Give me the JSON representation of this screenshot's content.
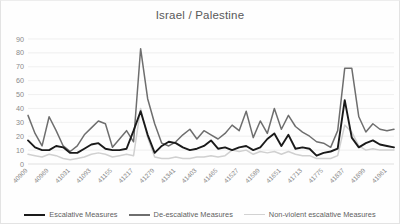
{
  "chart_data": {
    "type": "line",
    "title": "Israel / Palestine",
    "xlabel": "",
    "ylabel": "",
    "ylim": [
      0,
      90
    ],
    "ytick_step": 10,
    "yticks": [
      0,
      10,
      20,
      30,
      40,
      50,
      60,
      70,
      80,
      90
    ],
    "grid": true,
    "legend_position": "bottom",
    "x_tick_labels": [
      "40909",
      "40969",
      "41031",
      "41093",
      "41155",
      "41217",
      "41279",
      "41341",
      "41403",
      "41465",
      "41527",
      "41589",
      "41651",
      "41713",
      "41775",
      "41837",
      "41899",
      "41961"
    ],
    "x_tick_every": 3,
    "x": [
      "40909",
      "40929",
      "40949",
      "40969",
      "40989",
      "41011",
      "41031",
      "41051",
      "41071",
      "41093",
      "41113",
      "41133",
      "41155",
      "41175",
      "41195",
      "41217",
      "41237",
      "41257",
      "41279",
      "41299",
      "41319",
      "41341",
      "41361",
      "41381",
      "41403",
      "41423",
      "41443",
      "41465",
      "41485",
      "41505",
      "41527",
      "41547",
      "41567",
      "41589",
      "41609",
      "41629",
      "41651",
      "41671",
      "41691",
      "41713",
      "41733",
      "41753",
      "41775",
      "41795",
      "41815",
      "41837",
      "41857",
      "41877",
      "41899",
      "41919",
      "41939",
      "41961",
      "41981"
    ],
    "series": [
      {
        "name": "Escalative Measures",
        "color": "#1a1a1a",
        "width": 1.9,
        "values": [
          17,
          12,
          10,
          10,
          13,
          12,
          8,
          8,
          11,
          14,
          15,
          11,
          10,
          10,
          11,
          24,
          38,
          21,
          8,
          13,
          16,
          15,
          12,
          10,
          11,
          13,
          17,
          11,
          12,
          10,
          12,
          13,
          10,
          12,
          18,
          22,
          13,
          21,
          11,
          12,
          11,
          6,
          8,
          9,
          11,
          46,
          19,
          12,
          15,
          17,
          14,
          13,
          12
        ]
      },
      {
        "name": "De-escalative Measures",
        "color": "#6e6e6e",
        "width": 1.5,
        "values": [
          35,
          22,
          13,
          34,
          24,
          13,
          9,
          13,
          21,
          26,
          31,
          29,
          12,
          18,
          24,
          16,
          83,
          47,
          29,
          15,
          13,
          16,
          21,
          25,
          18,
          24,
          21,
          18,
          22,
          28,
          24,
          38,
          19,
          31,
          22,
          40,
          25,
          35,
          27,
          23,
          20,
          16,
          15,
          12,
          24,
          69,
          69,
          34,
          23,
          29,
          25,
          24,
          25
        ]
      },
      {
        "name": "Non-violent escalative Measures",
        "color": "#d0d0d0",
        "width": 1.5,
        "values": [
          7,
          6,
          5,
          7,
          6,
          4,
          3,
          4,
          5,
          7,
          8,
          7,
          5,
          6,
          7,
          6,
          40,
          19,
          5,
          4,
          4,
          5,
          4,
          4,
          5,
          5,
          6,
          5,
          6,
          10,
          9,
          10,
          7,
          9,
          8,
          9,
          7,
          9,
          7,
          6,
          6,
          4,
          4,
          4,
          6,
          28,
          23,
          13,
          10,
          11,
          10,
          10,
          10
        ]
      }
    ]
  },
  "legend": [
    {
      "label": "Escalative Measures",
      "color": "#1a1a1a",
      "width": "2.4px"
    },
    {
      "label": "De-escalative Measures",
      "color": "#6e6e6e",
      "width": "2px"
    },
    {
      "label": "Non-violent escalative Measures",
      "color": "#d2d2d2",
      "width": "1.6px"
    }
  ]
}
